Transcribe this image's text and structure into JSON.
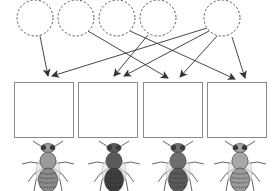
{
  "diagram": {
    "type": "matching-exercise",
    "circles": [
      {
        "id": "c1",
        "label": ""
      },
      {
        "id": "c2",
        "label": ""
      },
      {
        "id": "c3",
        "label": ""
      },
      {
        "id": "c4",
        "label": ""
      },
      {
        "id": "c5",
        "label": ""
      }
    ],
    "boxes": [
      {
        "id": "b1",
        "label": ""
      },
      {
        "id": "b2",
        "label": ""
      },
      {
        "id": "b3",
        "label": ""
      },
      {
        "id": "b4",
        "label": ""
      }
    ],
    "arrows": [
      {
        "from": "c1",
        "to": "b1"
      },
      {
        "from": "c2",
        "to": "b3"
      },
      {
        "from": "c3",
        "to": "b4"
      },
      {
        "from": "c4",
        "to": "b2"
      },
      {
        "from": "c5",
        "to": "b1"
      },
      {
        "from": "c5",
        "to": "b2"
      },
      {
        "from": "c5",
        "to": "b3"
      },
      {
        "from": "c5",
        "to": "b4"
      }
    ],
    "flies": [
      {
        "id": "f1",
        "shade": "light",
        "body_color": "#9a9a9a",
        "abdomen_color": "#8a8a8a"
      },
      {
        "id": "f2",
        "shade": "dark",
        "body_color": "#5a5a5a",
        "abdomen_color": "#3e3e3e"
      },
      {
        "id": "f3",
        "shade": "medium-dark",
        "body_color": "#6e6e6e",
        "abdomen_color": "#5a5a5a"
      },
      {
        "id": "f4",
        "shade": "light",
        "body_color": "#a8a8a8",
        "abdomen_color": "#9a9a9a"
      }
    ],
    "colors": {
      "circle_stroke": "#555555",
      "arrow": "#333333",
      "box_stroke": "#8a8a8a"
    }
  }
}
